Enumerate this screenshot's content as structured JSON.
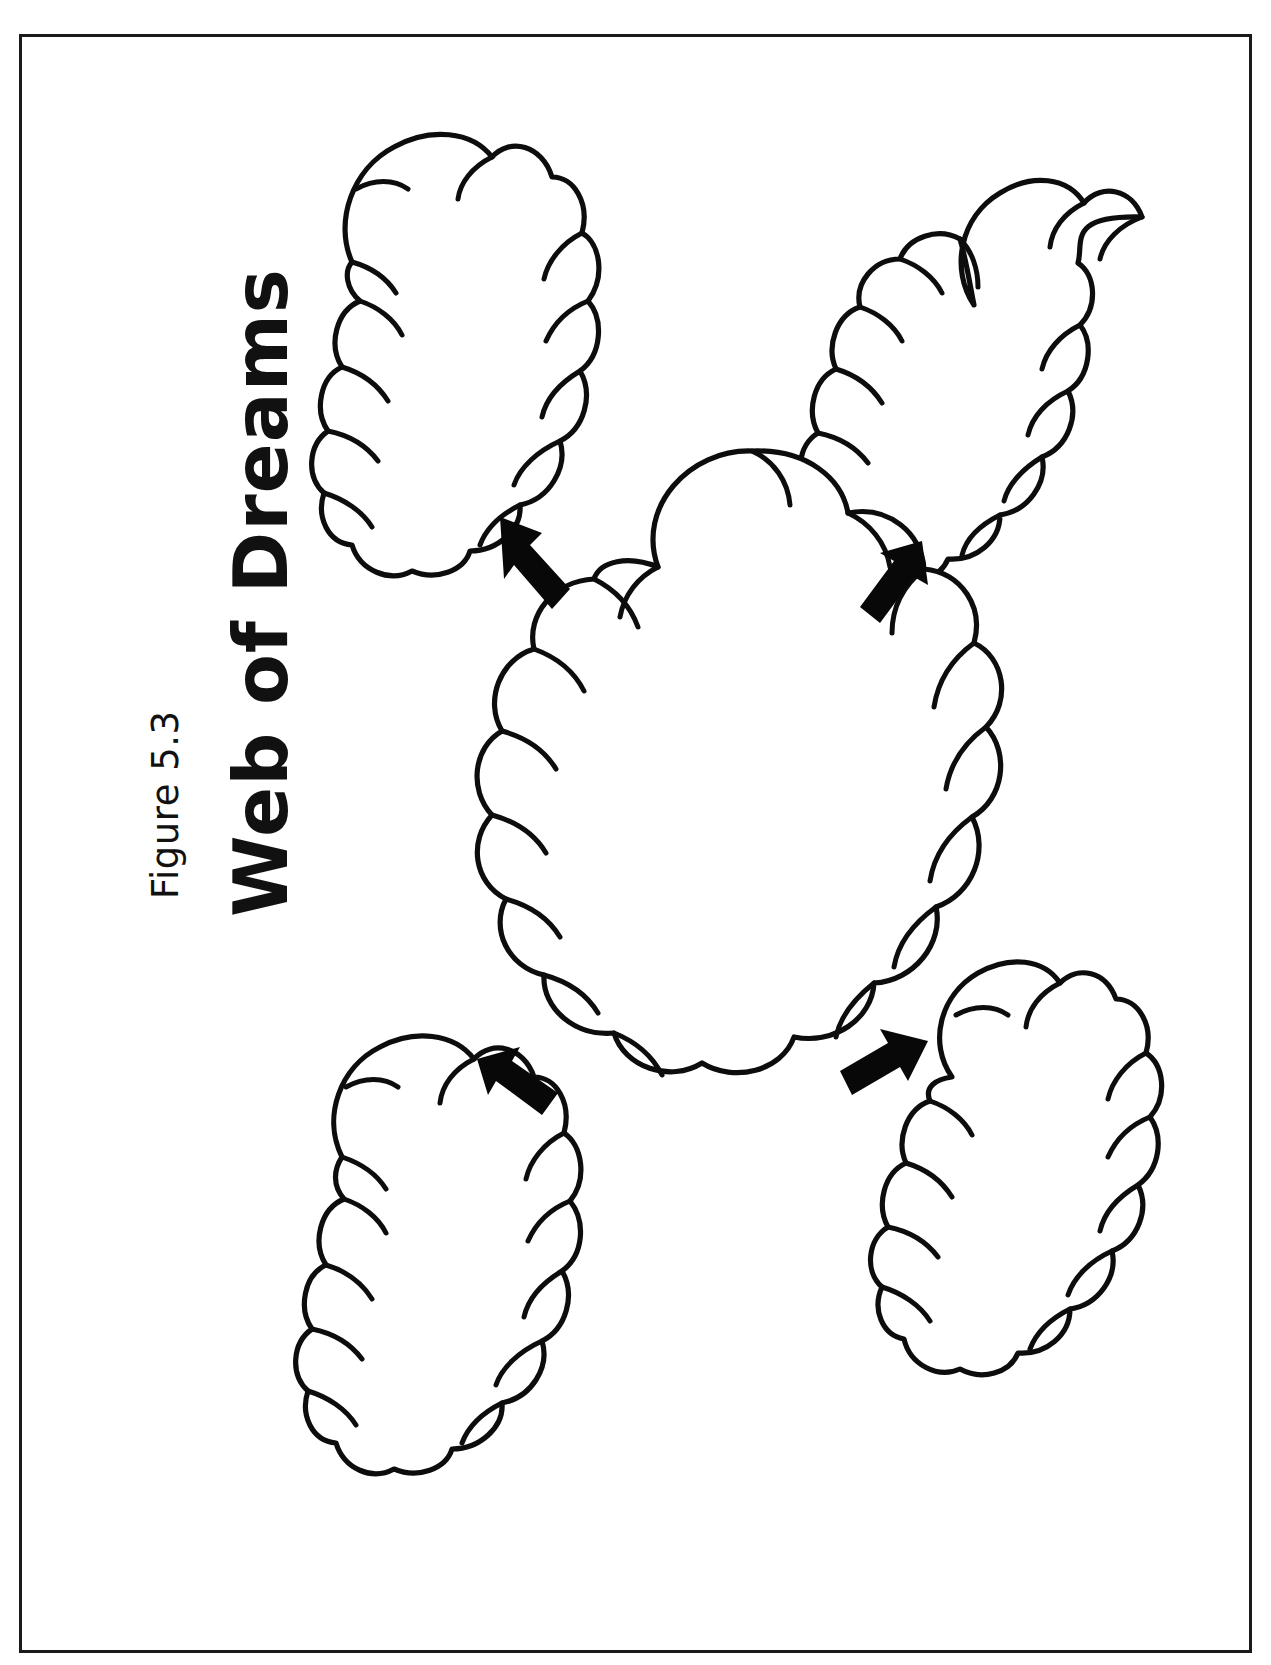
{
  "page": {
    "figure_label": "Figure 5.3",
    "title": "Web of Dreams",
    "background_color": "#ffffff",
    "ink_color": "#0d0d0d",
    "border_color": "#1a1a1a",
    "title_orientation": "rotated-90-counterclockwise"
  },
  "diagram": {
    "type": "graphic-organizer-web",
    "center_node": {
      "name": "central-dream-cloud",
      "label": "",
      "shape": "thought-cloud",
      "fill": "#ffffff",
      "outline": "#0d0d0d"
    },
    "satellite_nodes": [
      {
        "name": "cloud-top-left",
        "label": "",
        "shape": "lobed-cloud",
        "position": "top-left"
      },
      {
        "name": "cloud-top-right",
        "label": "",
        "shape": "lobed-cloud",
        "position": "top-right"
      },
      {
        "name": "cloud-bottom-left",
        "label": "",
        "shape": "lobed-cloud",
        "position": "bottom-left"
      },
      {
        "name": "cloud-bottom-right",
        "label": "",
        "shape": "lobed-cloud",
        "position": "bottom-right"
      }
    ],
    "connectors": [
      {
        "name": "arrow-to-top-left",
        "direction": "up-left",
        "style": "solid-block-arrow",
        "color": "#080808"
      },
      {
        "name": "arrow-to-top-right",
        "direction": "up-right",
        "style": "solid-block-arrow",
        "color": "#080808"
      },
      {
        "name": "arrow-to-bottom-left",
        "direction": "down-left",
        "style": "solid-block-arrow",
        "color": "#080808"
      },
      {
        "name": "arrow-to-bottom-right",
        "direction": "down-right",
        "style": "solid-block-arrow",
        "color": "#080808"
      }
    ],
    "writing_lines": 0,
    "notes": ""
  }
}
